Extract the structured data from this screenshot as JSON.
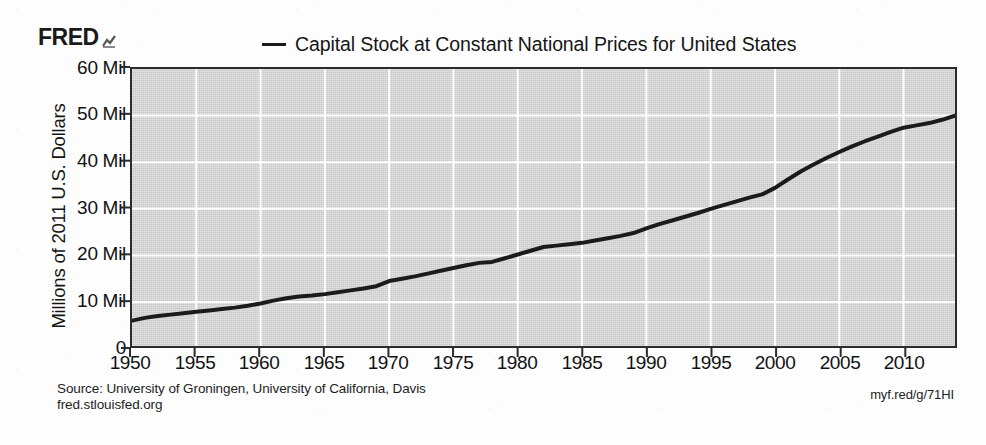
{
  "brand": {
    "name": "FRED",
    "logo_icon": "fred-chart-glyph"
  },
  "legend": {
    "marker_icon": "legend-line-marker",
    "label": "Capital Stock at Constant National Prices for United States"
  },
  "axes": {
    "ylabel": "Millions of 2011 U.S. Dollars",
    "yticks": [
      "0",
      "10 Mil",
      "20 Mil",
      "30 Mil",
      "40 Mil",
      "50 Mil",
      "60 Mil"
    ],
    "xticks": [
      "1950",
      "1955",
      "1960",
      "1965",
      "1970",
      "1975",
      "1980",
      "1985",
      "1990",
      "1995",
      "2000",
      "2005",
      "2010"
    ]
  },
  "footer": {
    "source": "Source: University of Groningen, University of California, Davis",
    "site": "fred.stlouisfed.org",
    "permalink": "myf.red/g/71HI"
  },
  "colors": {
    "line": "#1b1b1b",
    "plot_background": "#c8c8c8",
    "gridline": "#ffffff",
    "axis": "#2b2b2b",
    "text": "#121212"
  },
  "chart_data": {
    "type": "line",
    "title": "Capital Stock at Constant National Prices for United States",
    "xlabel": "",
    "ylabel": "Millions of 2011 U.S. Dollars",
    "xlim": [
      1950,
      2014
    ],
    "ylim": [
      0,
      60
    ],
    "yunit": "Millions of 2011 U.S. Dollars",
    "grid": true,
    "legend_position": "top",
    "series": [
      {
        "name": "Capital Stock at Constant National Prices for United States",
        "color": "#1b1b1b",
        "x": [
          1950,
          1951,
          1952,
          1953,
          1954,
          1955,
          1956,
          1957,
          1958,
          1959,
          1960,
          1961,
          1962,
          1963,
          1964,
          1965,
          1966,
          1967,
          1968,
          1969,
          1970,
          1971,
          1972,
          1973,
          1974,
          1975,
          1976,
          1977,
          1978,
          1979,
          1980,
          1981,
          1982,
          1983,
          1984,
          1985,
          1986,
          1987,
          1988,
          1989,
          1990,
          1991,
          1992,
          1993,
          1994,
          1995,
          1996,
          1997,
          1998,
          1999,
          2000,
          2001,
          2002,
          2003,
          2004,
          2005,
          2006,
          2007,
          2008,
          2009,
          2010,
          2011,
          2012,
          2013,
          2014
        ],
        "values": [
          6.0,
          6.6,
          7.0,
          7.3,
          7.6,
          7.9,
          8.2,
          8.5,
          8.8,
          9.2,
          9.7,
          10.3,
          10.8,
          11.2,
          11.4,
          11.7,
          12.1,
          12.5,
          12.9,
          13.4,
          14.5,
          15.0,
          15.5,
          16.1,
          16.7,
          17.3,
          17.9,
          18.4,
          18.6,
          19.4,
          20.2,
          21.0,
          21.8,
          22.1,
          22.4,
          22.7,
          23.2,
          23.7,
          24.2,
          24.8,
          25.8,
          26.7,
          27.5,
          28.3,
          29.1,
          30.0,
          30.8,
          31.6,
          32.4,
          33.1,
          34.5,
          36.3,
          38.0,
          39.5,
          40.9,
          42.2,
          43.4,
          44.5,
          45.5,
          46.5,
          47.4,
          47.9,
          48.4,
          49.1,
          50.0
        ]
      }
    ]
  }
}
